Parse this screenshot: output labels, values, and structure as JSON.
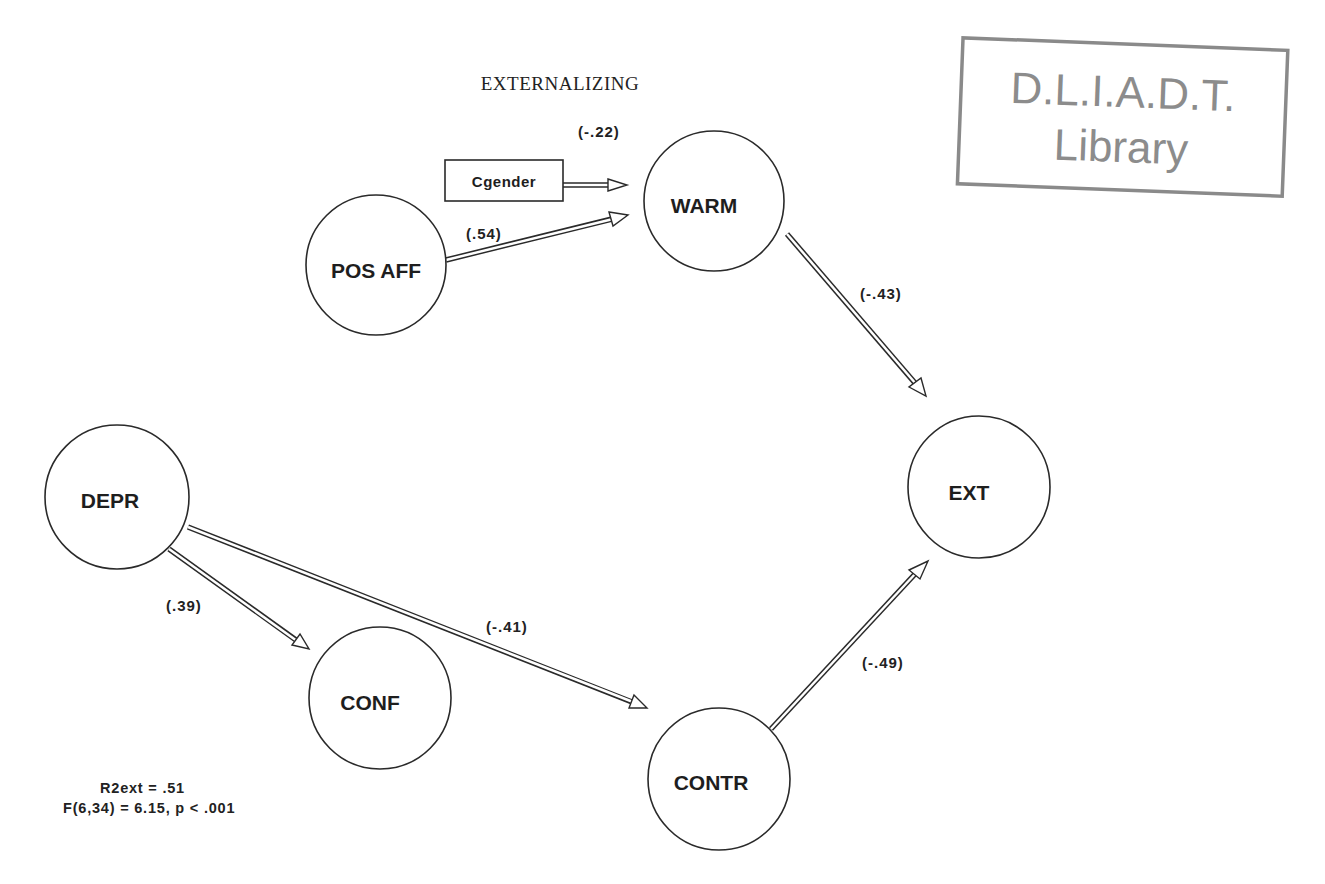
{
  "title": "EXTERNALIZING",
  "stamp": {
    "line1": "D.L.I.A.D.T.",
    "line2": "Library",
    "color": "#8c8c8c"
  },
  "nodes": {
    "pos_aff": {
      "label": "POS AFF",
      "cx": 376,
      "cy": 265,
      "r": 70
    },
    "warm": {
      "label": "WARM",
      "cx": 714,
      "cy": 201,
      "r": 70
    },
    "ext": {
      "label": "EXT",
      "cx": 979,
      "cy": 487,
      "r": 71
    },
    "depr": {
      "label": "DEPR",
      "cx": 117,
      "cy": 497,
      "r": 72
    },
    "conf": {
      "label": "CONF",
      "cx": 380,
      "cy": 698,
      "r": 71
    },
    "contr": {
      "label": "CONTR",
      "cx": 719,
      "cy": 779,
      "r": 71
    }
  },
  "boxes": {
    "cgender": {
      "label": "Cgender"
    }
  },
  "paths": [
    {
      "from": "Cgender",
      "to": "WARM",
      "coef": "(-.22)"
    },
    {
      "from": "POS AFF",
      "to": "WARM",
      "coef": "(.54)"
    },
    {
      "from": "WARM",
      "to": "EXT",
      "coef": "(-.43)"
    },
    {
      "from": "DEPR",
      "to": "CONF",
      "coef": "(.39)"
    },
    {
      "from": "DEPR",
      "to": "CONTR",
      "coef": "(-.41)"
    },
    {
      "from": "CONTR",
      "to": "EXT",
      "coef": "(-.49)"
    }
  ],
  "stats": {
    "r2": "R2ext = .51",
    "f_test": "F(6,34) = 6.15, p < .001"
  }
}
